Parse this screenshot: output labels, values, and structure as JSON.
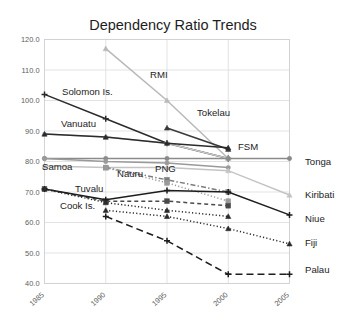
{
  "chart_data": {
    "type": "line",
    "title": "Dependency Ratio Trends",
    "xlabel": "",
    "ylabel": "",
    "x": [
      1985,
      1990,
      1995,
      2000,
      2005
    ],
    "categories": [
      "1985",
      "1990",
      "1995",
      "2000",
      "2005"
    ],
    "ylim": [
      40,
      120
    ],
    "yticks": [
      40.0,
      50.0,
      60.0,
      70.0,
      80.0,
      90.0,
      100.0,
      110.0,
      120.0
    ],
    "ytick_labels": [
      "40.0",
      "50.0",
      "60.0",
      "70.0",
      "80.0",
      "90.0",
      "100.0",
      "110.0",
      "120.0"
    ],
    "xtick_labels": [
      "1985",
      "1990",
      "1995",
      "2000",
      "2005"
    ],
    "grid": true,
    "legend_position": "inline-labels",
    "series": [
      {
        "name": "RMI",
        "label_side": "inline",
        "color": "#b9b9b9",
        "dash": "none",
        "marker": "triangle",
        "x": [
          1990,
          1995,
          2000
        ],
        "values": [
          117.0,
          100.0,
          81.0
        ]
      },
      {
        "name": "Solomon Is.",
        "label_side": "inline",
        "color": "#2b2b2b",
        "dash": "none",
        "marker": "plus",
        "x": [
          1985,
          1990,
          1995,
          2000
        ],
        "values": [
          102.0,
          94.0,
          86.0,
          81.0
        ]
      },
      {
        "name": "Tokelau",
        "label_side": "inline",
        "color": "#3a3a3a",
        "dash": "none",
        "marker": "triangle",
        "x": [
          1995,
          2000
        ],
        "values": [
          91.0,
          84.0
        ]
      },
      {
        "name": "Vanuatu",
        "label_side": "inline",
        "color": "#c9c9c9",
        "dash": "none",
        "marker": "dot",
        "x": [
          1985,
          1990,
          1995,
          2000
        ],
        "values": [
          89.0,
          88.0,
          86.0,
          81.0
        ]
      },
      {
        "name": "FSM",
        "label_side": "inline",
        "color": "#2b2b2b",
        "dash": "none",
        "marker": "triangle",
        "x": [
          1985,
          1990,
          1995,
          2000
        ],
        "values": [
          89.0,
          88.0,
          86.0,
          84.5
        ]
      },
      {
        "name": "Tonga",
        "label_side": "right",
        "color": "#8a8a8a",
        "dash": "none",
        "marker": "dot",
        "x": [
          1985,
          1990,
          1995,
          2000,
          2005
        ],
        "values": [
          81.0,
          81.0,
          81.0,
          81.0,
          81.0
        ]
      },
      {
        "name": "Samoa",
        "label_side": "inline",
        "color": "#9a9a9a",
        "dash": "none",
        "marker": "dot",
        "x": [
          1985,
          1990,
          1995,
          2000
        ],
        "values": [
          81.0,
          80.0,
          79.5,
          78.0
        ]
      },
      {
        "name": "Kiribati",
        "label_side": "right",
        "color": "#c4c4c4",
        "dash": "none",
        "marker": "triangle",
        "x": [
          1985,
          1990,
          1995,
          2000,
          2005
        ],
        "values": [
          78.5,
          78.0,
          78.0,
          77.0,
          69.0
        ]
      },
      {
        "name": "Nauru",
        "label_side": "inline",
        "color": "#7d7d7d",
        "dash": "dashdot",
        "marker": "square",
        "x": [
          1990,
          1995,
          2000
        ],
        "values": [
          78.0,
          74.0,
          70.0
        ]
      },
      {
        "name": "PNG",
        "label_side": "inline",
        "color": "#9a9a9a",
        "dash": "dotted",
        "marker": "square",
        "x": [
          1990,
          1995,
          2000
        ],
        "values": [
          78.0,
          73.0,
          67.0
        ]
      },
      {
        "name": "Tuvalu",
        "label_side": "inline",
        "color": "#4a4a4a",
        "dash": "dashed",
        "marker": "square",
        "x": [
          1985,
          1990,
          1995,
          2000
        ],
        "values": [
          71.0,
          67.0,
          67.0,
          65.5
        ]
      },
      {
        "name": "Niue",
        "label_side": "right",
        "color": "#1d1d1d",
        "dash": "none",
        "marker": "plus",
        "x": [
          1985,
          1990,
          1995,
          2000,
          2005
        ],
        "values": [
          71.0,
          67.5,
          70.5,
          70.0,
          62.5
        ]
      },
      {
        "name": "Cook Is.",
        "label_side": "inline",
        "color": "#2b2b2b",
        "dash": "dotted",
        "marker": "triangle",
        "x": [
          1985,
          1990,
          1995,
          2000
        ],
        "values": [
          71.0,
          66.5,
          64.0,
          62.0
        ]
      },
      {
        "name": "Fiji",
        "label_side": "right",
        "color": "#2b2b2b",
        "dash": "dotted",
        "marker": "triangle",
        "x": [
          1990,
          1995,
          2000,
          2005
        ],
        "values": [
          64.0,
          62.0,
          58.0,
          53.0
        ]
      },
      {
        "name": "Palau",
        "label_side": "right",
        "color": "#1d1d1d",
        "dash": "longdash",
        "marker": "plus",
        "x": [
          1990,
          1995,
          2000,
          2005
        ],
        "values": [
          62.0,
          54.0,
          43.0,
          43.0
        ]
      }
    ],
    "inline_annotations": [
      {
        "text": "RMI",
        "x": 150,
        "y": 78
      },
      {
        "text": "Solomon Is.",
        "x": 62,
        "y": 95
      },
      {
        "text": "Tokelau",
        "x": 197,
        "y": 116
      },
      {
        "text": "Vanuatu",
        "x": 61,
        "y": 127
      },
      {
        "text": "FSM",
        "x": 238,
        "y": 150
      },
      {
        "text": "Samoa",
        "x": 42,
        "y": 170
      },
      {
        "text": "Nauru",
        "x": 117,
        "y": 177
      },
      {
        "text": "PNG",
        "x": 155,
        "y": 172
      },
      {
        "text": "Tuvalu",
        "x": 75,
        "y": 192
      },
      {
        "text": "Cook Is.",
        "x": 60,
        "y": 209
      }
    ],
    "right_annotations": [
      {
        "text": "Tonga",
        "x": 305,
        "y": 165
      },
      {
        "text": "Kiribati",
        "x": 305,
        "y": 198
      },
      {
        "text": "Niue",
        "x": 305,
        "y": 222
      },
      {
        "text": "Fiji",
        "x": 305,
        "y": 246
      },
      {
        "text": "Palau",
        "x": 305,
        "y": 273
      }
    ]
  }
}
